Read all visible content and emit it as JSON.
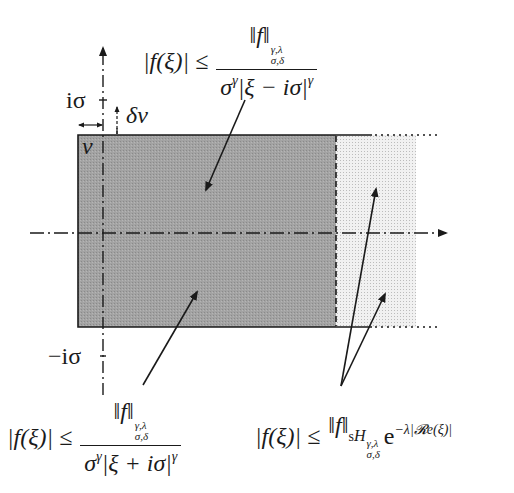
{
  "diagram": {
    "axis_labels": {
      "upper_tick": "iσ",
      "lower_tick": "−iσ",
      "nu": "ν",
      "delta_nu": "δν"
    },
    "regions": {
      "dark": {
        "description": "strip of width 2σ, dark-shaded",
        "color": "#9a9a9a"
      },
      "light": {
        "description": "continuation region, light dotted shading",
        "color": "#dedede"
      }
    },
    "colors": {
      "ink": "#1a1a1a",
      "dark_fill": "#9a9a9a",
      "light_fill": "#e2e2e2",
      "background": "#ffffff"
    },
    "formulas": {
      "upper": {
        "lhs": "|f(ξ)| ≤",
        "numerator_norm": "‖f‖",
        "numerator_space": "H",
        "numerator_sup": "γ,λ",
        "numerator_sub": "σ,δ",
        "denominator": "σ^γ|ξ − iσ|^γ",
        "den_base": "σ",
        "den_exp": "γ",
        "den_abs": "|ξ − iσ|",
        "den_abs_exp": "γ"
      },
      "lower_left": {
        "lhs": "|f(ξ)| ≤",
        "numerator_norm": "‖f‖",
        "numerator_space": "H",
        "numerator_sup": "γ,λ",
        "numerator_sub": "σ,δ",
        "den_base": "σ",
        "den_exp": "γ",
        "den_abs": "|ξ + iσ|",
        "den_abs_exp": "γ"
      },
      "lower_right": {
        "lhs": "|f(ξ)| ≤",
        "norm": "‖f‖",
        "space_prefix": "s",
        "space": "H",
        "space_sup": "γ,λ",
        "space_sub": "σ,δ",
        "exp_base": "e",
        "exponent": "−λ|𝓡e(ξ)|"
      }
    }
  }
}
